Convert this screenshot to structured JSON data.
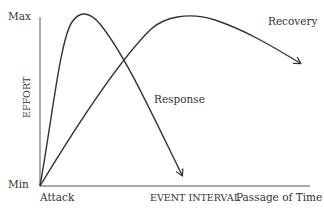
{
  "diagram": {
    "y_axis": {
      "label": "EFFORT",
      "max_label": "Max",
      "min_label": "Min"
    },
    "x_axis": {
      "start_label": "Attack",
      "middle_label": "EVENT INTERVAL",
      "end_label": "Passage of Time"
    },
    "curves": [
      {
        "name": "Response",
        "label": "Response",
        "description": "Rises steeply to Max shortly after Attack, then falls back toward Min near the event interval"
      },
      {
        "name": "Recovery",
        "label": "Recovery",
        "description": "Rises gradually from Min at Attack to Max near the event interval, then slowly declines over time"
      }
    ],
    "colors": {
      "line": "#333333",
      "axis": "#555555",
      "text": "#333333"
    }
  }
}
